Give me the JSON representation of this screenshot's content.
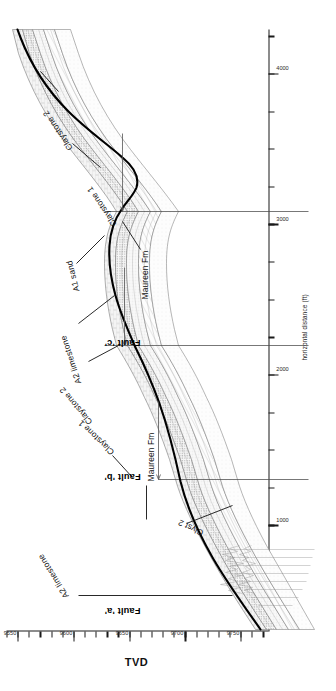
{
  "figure": {
    "name": "geological-cross-section",
    "orientation": "portrait-rotated-90"
  },
  "axes": {
    "tvd": {
      "title": "TVD",
      "unit": "ft",
      "ticks": [
        9550,
        9600,
        9650,
        9700,
        9750
      ],
      "labels": [
        "9550",
        "9600",
        "9650",
        "9700",
        "9750"
      ],
      "min": 9540,
      "max": 9775,
      "minor_step": 10
    },
    "horizontal": {
      "title": "horizontal distance (ft)",
      "ticks": [
        1000,
        2000,
        3000,
        4000
      ],
      "labels": [
        "1000",
        "2000",
        "3000",
        "4000"
      ],
      "min": 300,
      "max": 4300,
      "minor_step": 250
    }
  },
  "faults": [
    {
      "id": "fault-a",
      "label": "Fault 'a'",
      "x": 1150
    },
    {
      "id": "fault-b",
      "label": "Fault 'b'",
      "x": 2150
    },
    {
      "id": "fault-c",
      "label": "Fault 'c'",
      "x": 3080
    }
  ],
  "annotations": [
    {
      "id": "a2-limestone-left",
      "label": "A2 limestone"
    },
    {
      "id": "clyst-2-left",
      "label": "Clyst 2"
    },
    {
      "id": "maureen-fm-left",
      "label": "Maureen Fm"
    },
    {
      "id": "claystone-1-left",
      "label": "Claystone 1"
    },
    {
      "id": "claystone-2-mid",
      "label": "Claystone 2"
    },
    {
      "id": "a2-limestone-mid",
      "label": "A2 limestone"
    },
    {
      "id": "a1-sand-mid",
      "label": "A1 sand"
    },
    {
      "id": "maureen-fm-mid",
      "label": "Maureen Fm"
    },
    {
      "id": "claystone-1-right",
      "label": "Claystone 1"
    },
    {
      "id": "claystone-2-right",
      "label": "Claystone 2"
    }
  ],
  "legend_units": {
    "a2_limestone": "A2 limestone",
    "claystone_2": "Claystone 2",
    "a1_sand": "A1 sand",
    "claystone_1": "Claystone 1",
    "maureen_fm": "Maureen Fm",
    "clyst_2": "Clyst 2"
  },
  "colors": {
    "wellbore": "#000000",
    "horizon": "#6e6e6e",
    "fill_light": "#f2f2f2",
    "fill_stipple": "#e3e3e3",
    "fault": "#555555",
    "axis": "#1a1a1a",
    "text": "#111111"
  },
  "chart_data": {
    "type": "line",
    "title": "",
    "xlabel": "horizontal distance (ft)",
    "ylabel": "TVD",
    "xlim": [
      300,
      4300
    ],
    "ylim": [
      9540,
      9775
    ],
    "y_inverted": true,
    "grid": false,
    "legend": "none",
    "series": [
      {
        "name": "wellbore trajectory",
        "style": "heavy-black-line",
        "x": [
          320,
          420,
          520,
          620,
          720,
          820,
          920,
          1020,
          1120,
          1150,
          1260,
          1400,
          1550,
          1700,
          1850,
          2000,
          2100,
          2150,
          2260,
          2400,
          2520,
          2640,
          2760,
          2880,
          3000,
          3080,
          3180,
          3300,
          3420,
          3560,
          3700,
          3850,
          4000,
          4150,
          4300
        ],
        "y": [
          9770,
          9763,
          9755,
          9747,
          9740,
          9733,
          9727,
          9722,
          9718,
          9717,
          9714,
          9710,
          9706,
          9701,
          9694,
          9686,
          9679,
          9675,
          9666,
          9656,
          9650,
          9647,
          9648,
          9652,
          9657,
          9659,
          9660,
          9657,
          9650,
          9639,
          9628,
          9617,
          9608,
          9601,
          9597
        ]
      },
      {
        "name": "A2 limestone top",
        "style": "thin-grey-line",
        "x": [
          320,
          600,
          900,
          1150,
          1500,
          1900,
          2150,
          2500,
          2900,
          3080,
          3400,
          3800,
          4300
        ],
        "y": [
          9757,
          9737,
          9718,
          9708,
          9698,
          9681,
          9666,
          9641,
          9634,
          9642,
          9640,
          9614,
          9590
        ]
      },
      {
        "name": "Claystone 2 top",
        "style": "thin-grey-line",
        "x": [
          320,
          600,
          900,
          1150,
          1500,
          1900,
          2150,
          2500,
          2900,
          3080,
          3400,
          3800,
          4300
        ],
        "y": [
          9761,
          9741,
          9722,
          9712,
          9702,
          9685,
          9671,
          9647,
          9641,
          9648,
          9646,
          9619,
          9594
        ]
      },
      {
        "name": "A1 sand top",
        "style": "thin-grey-line",
        "x": [
          320,
          600,
          900,
          1150,
          1500,
          1900,
          2150,
          2500,
          2900,
          3080,
          3400,
          3800,
          4300
        ],
        "y": [
          9766,
          9746,
          9727,
          9717,
          9707,
          9691,
          9677,
          9654,
          9649,
          9656,
          9653,
          9625,
          9599
        ]
      },
      {
        "name": "Claystone 1 top",
        "style": "thin-grey-line",
        "x": [
          320,
          600,
          900,
          1150,
          1500,
          1900,
          2150,
          2500,
          2900,
          3080,
          3400,
          3800,
          4300
        ],
        "y": [
          9771,
          9752,
          9733,
          9723,
          9713,
          9697,
          9684,
          9661,
          9657,
          9664,
          9661,
          9632,
          9605
        ]
      },
      {
        "name": "Maureen Fm top",
        "style": "thin-grey-line",
        "x": [
          320,
          600,
          900,
          1150,
          1500,
          1900,
          2150,
          2500,
          2900,
          3080,
          3400,
          3800,
          4300
        ],
        "y": [
          9776,
          9758,
          9740,
          9730,
          9720,
          9704,
          9692,
          9670,
          9666,
          9673,
          9670,
          9640,
          9612
        ]
      }
    ]
  }
}
